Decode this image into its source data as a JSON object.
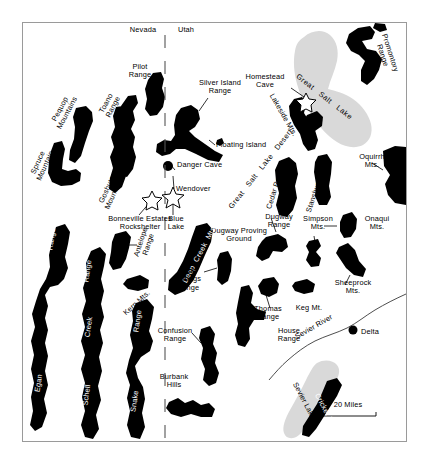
{
  "map": {
    "title": "Great Salt Lake Desert and Eastern Great Basin",
    "background_color": "#ffffff",
    "frame_color": "#9a9a9a",
    "mountain_color": "#000000",
    "lake_color": "#d9d9d9",
    "states": [
      {
        "name": "Nevada",
        "side": "west"
      },
      {
        "name": "Utah",
        "side": "east"
      }
    ],
    "state_border": {
      "label_left": "Nevada",
      "label_right": "Utah",
      "style": "dashed"
    },
    "scale_bar": {
      "label": "20 Miles",
      "distance": 20,
      "unit": "Miles"
    },
    "water_bodies": [
      {
        "name": "Great Salt Lake",
        "color": "#d9d9d9"
      },
      {
        "name": "Sevier Lake",
        "color": "#d9d9d9"
      }
    ],
    "rivers": [
      {
        "name": "Sevier River"
      }
    ],
    "regions": [
      {
        "name": "Great Salt Lake Desert"
      },
      {
        "name": "Dugway Proving Ground"
      }
    ],
    "mountain_ranges": [
      {
        "name": "Pilot Range",
        "label_style": "leader"
      },
      {
        "name": "Silver Island Range",
        "label_style": "leader"
      },
      {
        "name": "Pequop Mountains",
        "label_style": "leader"
      },
      {
        "name": "Toano Range",
        "label_style": "leader"
      },
      {
        "name": "Spruce Mountain",
        "label_style": "plain"
      },
      {
        "name": "Goshute Mountains",
        "label_style": "leader"
      },
      {
        "name": "Promontory Range",
        "label_style": "plain"
      },
      {
        "name": "Lakeside Mts.",
        "label_style": "plain"
      },
      {
        "name": "Cedar Range",
        "label_style": "plain"
      },
      {
        "name": "Stansbury Range",
        "label_style": "plain"
      },
      {
        "name": "Oquirrh Mts.",
        "label_style": "leader"
      },
      {
        "name": "Onaqui Mts.",
        "label_style": "leader"
      },
      {
        "name": "Simpson Mts.",
        "label_style": "leader"
      },
      {
        "name": "Sheeprock Mts.",
        "label_style": "leader"
      },
      {
        "name": "Dugway Range",
        "label_style": "leader"
      },
      {
        "name": "Thomas Range",
        "label_style": "leader"
      },
      {
        "name": "Keg Mt.",
        "label_style": "plain"
      },
      {
        "name": "House Range",
        "label_style": "leader"
      },
      {
        "name": "Fish Springs Range",
        "label_style": "leader"
      },
      {
        "name": "Deep Creek Mts.",
        "label_style": "inset-white"
      },
      {
        "name": "Antelope Range",
        "label_style": "leader"
      },
      {
        "name": "Kern Mts.",
        "label_style": "plain"
      },
      {
        "name": "Confusion Range",
        "label_style": "leader"
      },
      {
        "name": "Burbank Hills",
        "label_style": "plain"
      },
      {
        "name": "Egan Range",
        "label_style": "inset-white"
      },
      {
        "name": "Schell Creek Range",
        "label_style": "inset-white"
      },
      {
        "name": "Snake Range",
        "label_style": "inset-white"
      },
      {
        "name": "Cricket Mts.",
        "label_style": "inset-white"
      }
    ],
    "archaeological_sites": [
      {
        "name": "Homestead Cave",
        "marker": "star"
      },
      {
        "name": "Danger Cave",
        "marker": "dot"
      },
      {
        "name": "Bonneville Estates Rockshelter",
        "marker": "star"
      },
      {
        "name": "Blue Lake",
        "marker": "star"
      },
      {
        "name": "Floating Island",
        "marker": "dot"
      }
    ],
    "settlements": [
      {
        "name": "Wendover",
        "marker": "none"
      },
      {
        "name": "Delta",
        "marker": "dot"
      }
    ],
    "labels": {
      "nevada": "Nevada",
      "utah": "Utah",
      "pilot_range": "Pilot\nRange",
      "silver_island_range": "Silver Island\nRange",
      "pequop_mountains": "Pequop\nMountains",
      "toano_range": "Toano\nRange",
      "spruce_mountain": "Spruce\nMountain",
      "goshute_mountains": "Goshute\nMountains",
      "homestead_cave": "Homestead\nCave",
      "great_salt_lake": "Great   Salt   Lake",
      "promontory_range": "Promontory\nRange",
      "lakeside_mts": "Lakeside Mts.",
      "floating_island": "Floating Island",
      "danger_cave": "Danger Cave",
      "wendover": "Wendover",
      "bonneville_estates": "Bonneville Estates\nRockshelter",
      "blue_lake": "Blue\nLake",
      "great_salt_lake_desert": "Great   Salt   Lake   Desert",
      "cedar_range": "Cedar Range",
      "stansbury_range": "Stansbury Range",
      "oquirrh_mts": "Oquirrh\nMts.",
      "dugway_range": "Dugway\nRange",
      "simpson_mts": "Simpson\nMts.",
      "onaqui_mts": "Onaqui\nMts.",
      "sheeprock_mts": "Sheeprock\nMts.",
      "dugway_proving_ground": "Dugway Proving\nGround",
      "deep_creek_mts": "Deep  Creek  Mts.",
      "antelope_range": "Antelope\nRange",
      "fish_springs_range": "Fish\nSprings\nRange",
      "thomas_range": "Thomas\nRange",
      "keg_mt": "Keg Mt.",
      "kern_mts": "Kern Mts.",
      "confusion_range": "Confusion\nRange",
      "house_range": "House\nRange",
      "sevier_river": "Sevier River",
      "delta": "Delta",
      "burbank_hills": "Burbank\nHills",
      "sevier_lake": "Sevier Lake",
      "cricket_mts": "Cricket Mts.",
      "egan_range_a": "Range",
      "egan_range_b": "Egan",
      "schell_creek_a": "Range",
      "schell_creek_b": "Creek",
      "schell_creek_c": "Schell",
      "snake_range_a": "Range",
      "snake_range_b": "Snake",
      "scale": "20 Miles"
    }
  }
}
